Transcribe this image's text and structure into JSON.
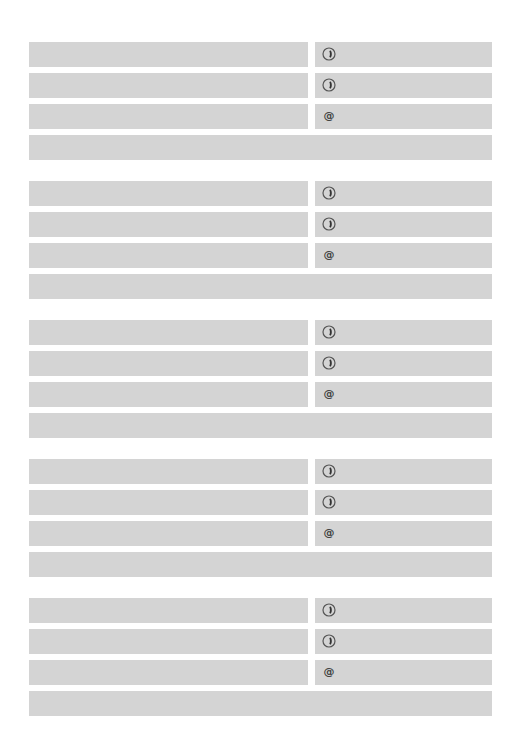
{
  "form": {
    "groups": [
      {
        "rows": [
          {
            "type": "phone",
            "icon": "phone-icon"
          },
          {
            "type": "phone",
            "icon": "phone-icon"
          },
          {
            "type": "email",
            "icon": "at-icon",
            "symbol": "@"
          },
          {
            "type": "full"
          }
        ]
      },
      {
        "rows": [
          {
            "type": "phone",
            "icon": "phone-icon"
          },
          {
            "type": "phone",
            "icon": "phone-icon"
          },
          {
            "type": "email",
            "icon": "at-icon",
            "symbol": "@"
          },
          {
            "type": "full"
          }
        ]
      },
      {
        "rows": [
          {
            "type": "phone",
            "icon": "phone-icon"
          },
          {
            "type": "phone",
            "icon": "phone-icon"
          },
          {
            "type": "email",
            "icon": "at-icon",
            "symbol": "@"
          },
          {
            "type": "full"
          }
        ]
      },
      {
        "rows": [
          {
            "type": "phone",
            "icon": "phone-icon"
          },
          {
            "type": "phone",
            "icon": "phone-icon"
          },
          {
            "type": "email",
            "icon": "at-icon",
            "symbol": "@"
          },
          {
            "type": "full"
          }
        ]
      },
      {
        "rows": [
          {
            "type": "phone",
            "icon": "phone-icon"
          },
          {
            "type": "phone",
            "icon": "phone-icon"
          },
          {
            "type": "email",
            "icon": "at-icon",
            "symbol": "@"
          },
          {
            "type": "full"
          }
        ]
      }
    ],
    "colors": {
      "field": "#d4d4d4",
      "background": "#ffffff",
      "icon": "#444444"
    }
  }
}
